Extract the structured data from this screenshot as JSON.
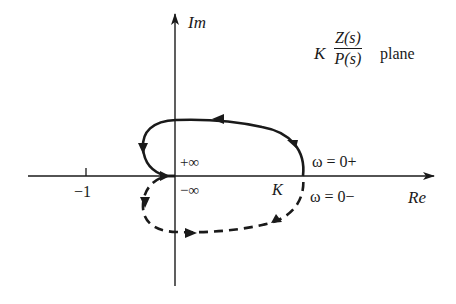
{
  "figure": {
    "plane_label": {
      "gain": "K",
      "numerator": "Z(s)",
      "denominator": "P(s)",
      "suffix": "plane"
    },
    "axes": {
      "imag_label": "Im",
      "real_label": "Re",
      "tick_minus_one": "−1"
    },
    "annotations": {
      "plus_infinity": "+∞",
      "minus_infinity": "−∞",
      "K_point": "K",
      "omega_zero_plus": "ω = 0+",
      "omega_zero_minus": "ω = 0−"
    },
    "curves": {
      "upper": {
        "style": "solid",
        "description": "ω from 0+ to +∞, from K counterclockwise to origin"
      },
      "lower": {
        "style": "dashed",
        "description": "ω from −∞ to 0−, from origin back to K"
      }
    },
    "colors": {
      "ink": "#1a1a1a",
      "background": "#ffffff"
    }
  }
}
